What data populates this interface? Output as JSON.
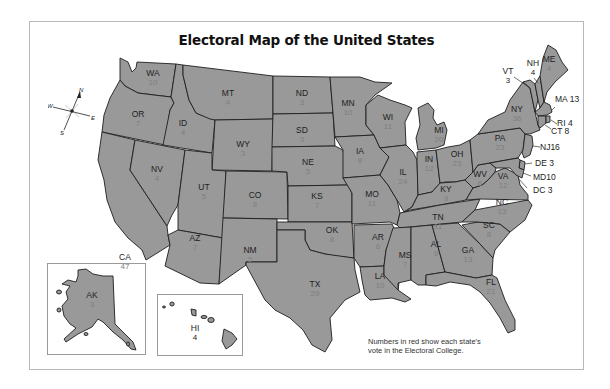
{
  "title": "Electoral Map of the United States",
  "note": {
    "line1": "Numbers in red show each state's",
    "line2": "vote in the Electoral College."
  },
  "compass": {
    "n": "N",
    "s": "S",
    "e": "E",
    "w": "W"
  },
  "colors": {
    "state_fill": "#999999",
    "border": "#1e1e1e",
    "vote_number": "#7f7f7f",
    "frame": "#b8b8b8"
  },
  "states": {
    "WA": {
      "abbr": "WA",
      "votes": "10"
    },
    "OR": {
      "abbr": "OR",
      "votes": "7"
    },
    "CA": {
      "abbr": "CA",
      "votes": "47"
    },
    "ID": {
      "abbr": "ID",
      "votes": "4"
    },
    "NV": {
      "abbr": "NV",
      "votes": "4"
    },
    "MT": {
      "abbr": "MT",
      "votes": "4"
    },
    "WY": {
      "abbr": "WY",
      "votes": "3"
    },
    "UT": {
      "abbr": "UT",
      "votes": "5"
    },
    "AZ": {
      "abbr": "AZ",
      "votes": "7"
    },
    "CO": {
      "abbr": "CO",
      "votes": "8"
    },
    "NM": {
      "abbr": "NM",
      "votes": "5"
    },
    "ND": {
      "abbr": "ND",
      "votes": "3"
    },
    "SD": {
      "abbr": "SD",
      "votes": "3"
    },
    "NE": {
      "abbr": "NE",
      "votes": "5"
    },
    "KS": {
      "abbr": "KS",
      "votes": "7"
    },
    "OK": {
      "abbr": "OK",
      "votes": "8"
    },
    "TX": {
      "abbr": "TX",
      "votes": "29"
    },
    "MN": {
      "abbr": "MN",
      "votes": "10"
    },
    "IA": {
      "abbr": "IA",
      "votes": "8"
    },
    "MO": {
      "abbr": "MO",
      "votes": "11"
    },
    "AR": {
      "abbr": "AR",
      "votes": "6"
    },
    "LA": {
      "abbr": "LA",
      "votes": "10"
    },
    "WI": {
      "abbr": "WI",
      "votes": "11"
    },
    "IL": {
      "abbr": "IL",
      "votes": "24"
    },
    "MI": {
      "abbr": "MI",
      "votes": "20"
    },
    "IN": {
      "abbr": "IN",
      "votes": "12"
    },
    "OH": {
      "abbr": "OH",
      "votes": "23"
    },
    "KY": {
      "abbr": "KY",
      "votes": "9"
    },
    "TN": {
      "abbr": "TN",
      "votes": "11"
    },
    "MS": {
      "abbr": "MS",
      "votes": "7"
    },
    "AL": {
      "abbr": "AL",
      "votes": "9"
    },
    "GA": {
      "abbr": "GA",
      "votes": "13"
    },
    "FL": {
      "abbr": "FL",
      "votes": "21"
    },
    "SC": {
      "abbr": "SC",
      "votes": "8"
    },
    "NC": {
      "abbr": "NC",
      "votes": "13"
    },
    "VA": {
      "abbr": "VA",
      "votes": "12"
    },
    "WV": {
      "abbr": "WV",
      "votes": "6"
    },
    "PA": {
      "abbr": "PA",
      "votes": "23"
    },
    "NY": {
      "abbr": "NY",
      "votes": "36"
    },
    "VT": {
      "abbr": "VT",
      "votes": "3"
    },
    "NH": {
      "abbr": "NH",
      "votes": "4"
    },
    "ME": {
      "abbr": "ME",
      "votes": "4"
    },
    "MA": {
      "abbr": "MA",
      "votes": "13"
    },
    "RI": {
      "abbr": "RI",
      "votes": "4"
    },
    "CT": {
      "abbr": "CT",
      "votes": "8"
    },
    "NJ": {
      "abbr": "NJ",
      "votes": "16"
    },
    "DE": {
      "abbr": "DE",
      "votes": "3"
    },
    "MD": {
      "abbr": "MD",
      "votes": "10"
    },
    "DC": {
      "abbr": "DC",
      "votes": "3"
    },
    "AK": {
      "abbr": "AK",
      "votes": "3"
    },
    "HI": {
      "abbr": "HI",
      "votes": "4"
    }
  }
}
